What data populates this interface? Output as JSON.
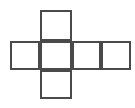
{
  "figure": {
    "name": "cube-net",
    "background_color": "#ffffff",
    "stroke_color": "#4a4a4a",
    "fill_color": "#ffffff",
    "stroke_width": 2,
    "canvas": {
      "width": 135,
      "height": 108
    },
    "grid": {
      "cell_size": 30,
      "columns_x": [
        10,
        40,
        72,
        101,
        131
      ],
      "rows_y": [
        10,
        41,
        70,
        99
      ]
    },
    "squares": [
      {
        "id": "square-top",
        "x": 40,
        "y": 10,
        "width": 32,
        "height": 31
      },
      {
        "id": "square-middle-left",
        "x": 10,
        "y": 41,
        "width": 30,
        "height": 29
      },
      {
        "id": "square-middle-inner",
        "x": 40,
        "y": 41,
        "width": 32,
        "height": 29
      },
      {
        "id": "square-middle-right",
        "x": 72,
        "y": 41,
        "width": 29,
        "height": 29
      },
      {
        "id": "square-middle-end",
        "x": 101,
        "y": 41,
        "width": 30,
        "height": 29
      },
      {
        "id": "square-bottom",
        "x": 40,
        "y": 70,
        "width": 32,
        "height": 29
      }
    ],
    "labels": []
  }
}
